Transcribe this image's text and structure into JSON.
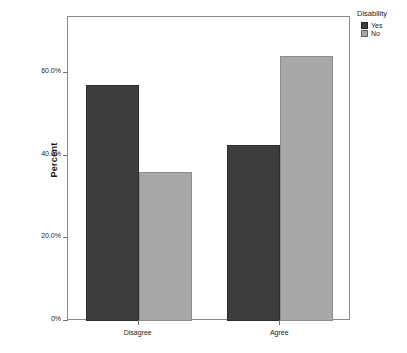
{
  "chart_data": {
    "type": "bar",
    "title": "",
    "subtitle": "",
    "xlabel": "",
    "ylabel": "Percent",
    "categories": [
      "Disagree",
      "Agree"
    ],
    "series": [
      {
        "name": "Yes",
        "values": [
          57.0,
          42.5
        ],
        "color": "#3d3d3d"
      },
      {
        "name": "No",
        "values": [
          36.0,
          64.0
        ],
        "color": "#a8a8a8"
      }
    ],
    "ylim": [
      0,
      72
    ],
    "yticks": [
      0,
      20,
      40,
      60
    ],
    "ytick_labels": [
      "0%",
      "20.0%",
      "40.0%",
      "60.0%"
    ],
    "grid": false,
    "legend": {
      "title": "Disability",
      "position": "top-right",
      "entries": [
        "Yes",
        "No"
      ]
    }
  },
  "axes": {
    "y_title": "Percent",
    "y_ticks": [
      {
        "label": "0%",
        "value": 0
      },
      {
        "label": "20.0%",
        "value": 20
      },
      {
        "label": "40.0%",
        "value": 40
      },
      {
        "label": "60.0%",
        "value": 60
      }
    ],
    "x_ticks": [
      {
        "label": "Disagree"
      },
      {
        "label": "Agree"
      }
    ]
  },
  "legend": {
    "title": "Disability",
    "items": [
      {
        "label": "Yes",
        "color": "#3d3d3d"
      },
      {
        "label": "No",
        "color": "#a8a8a8"
      }
    ]
  }
}
